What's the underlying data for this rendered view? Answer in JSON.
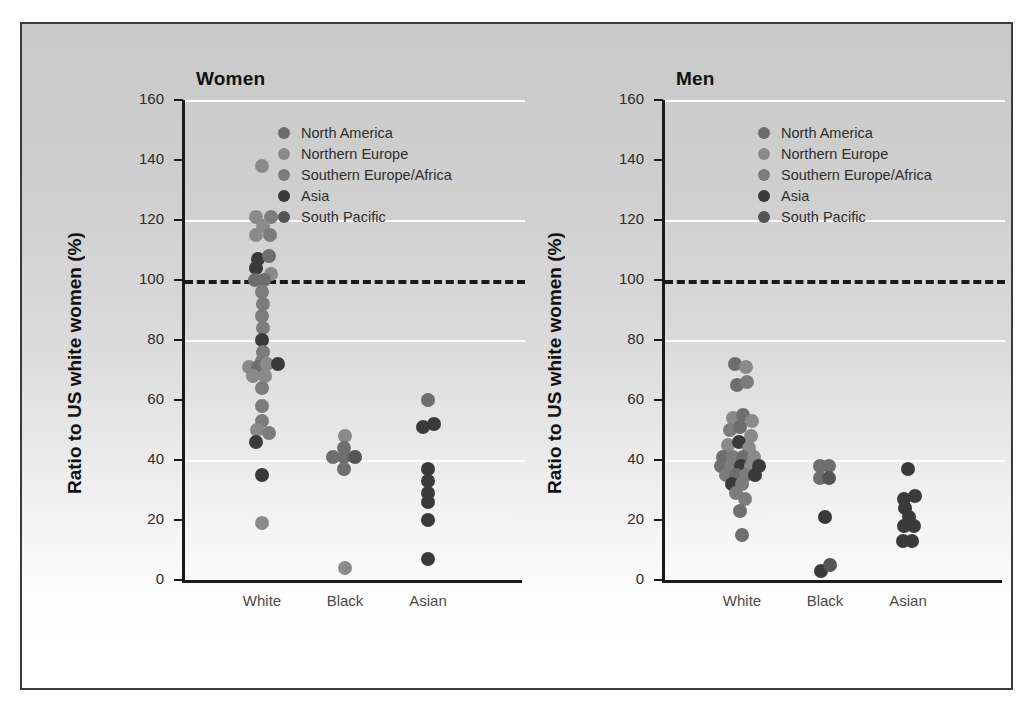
{
  "figure": {
    "background_top": "#c9c9c9",
    "background_bottom": "#ffffff",
    "border_color": "#3b3b3b"
  },
  "legend": {
    "entries": [
      {
        "label": "North America",
        "color": "#6e6e6e"
      },
      {
        "label": "Northern Europe",
        "color": "#8a8a8a"
      },
      {
        "label": "Southern Europe/Africa",
        "color": "#7c7c7c"
      },
      {
        "label": "Asia",
        "color": "#3a3a3a"
      },
      {
        "label": "South Pacific",
        "color": "#555555"
      }
    ]
  },
  "axis": {
    "ylabel": "Ratio to US  white women (%)",
    "yticks": [
      0,
      20,
      40,
      60,
      80,
      100,
      120,
      140,
      160
    ],
    "ylim": [
      0,
      160
    ],
    "gridlines": [
      40,
      80,
      120,
      160
    ],
    "reference_line": 100,
    "categories": [
      "White",
      "Black",
      "Asian"
    ]
  },
  "chart_data": {
    "type": "scatter",
    "xlabel": "",
    "ylabel": "Ratio to US  white women (%)",
    "ylim": [
      0,
      160
    ],
    "grid": true,
    "legend_position": "inside-top-right",
    "categories": [
      "White",
      "Black",
      "Asian"
    ],
    "reference_line": 100,
    "panels": [
      {
        "name": "Women",
        "points": [
          {
            "cat": "White",
            "x_off": 0,
            "y": 138,
            "region": "Northern Europe"
          },
          {
            "cat": "White",
            "x_off": -6,
            "y": 121,
            "region": "Northern Europe"
          },
          {
            "cat": "White",
            "x_off": 9,
            "y": 121,
            "region": "Southern Europe/Africa"
          },
          {
            "cat": "White",
            "x_off": 1,
            "y": 118,
            "region": "Northern Europe"
          },
          {
            "cat": "White",
            "x_off": -6,
            "y": 115,
            "region": "Northern Europe"
          },
          {
            "cat": "White",
            "x_off": 8,
            "y": 115,
            "region": "Southern Europe/Africa"
          },
          {
            "cat": "White",
            "x_off": -4,
            "y": 107,
            "region": "Asia"
          },
          {
            "cat": "White",
            "x_off": 7,
            "y": 108,
            "region": "North America"
          },
          {
            "cat": "White",
            "x_off": -6,
            "y": 104,
            "region": "Asia"
          },
          {
            "cat": "White",
            "x_off": 9,
            "y": 102,
            "region": "Northern Europe"
          },
          {
            "cat": "White",
            "x_off": -7,
            "y": 100,
            "region": "North America"
          },
          {
            "cat": "White",
            "x_off": 2,
            "y": 100,
            "region": "North America"
          },
          {
            "cat": "White",
            "x_off": 0,
            "y": 96,
            "region": "Southern Europe/Africa"
          },
          {
            "cat": "White",
            "x_off": 1,
            "y": 92,
            "region": "Southern Europe/Africa"
          },
          {
            "cat": "White",
            "x_off": 0,
            "y": 88,
            "region": "Southern Europe/Africa"
          },
          {
            "cat": "White",
            "x_off": 1,
            "y": 84,
            "region": "Southern Europe/Africa"
          },
          {
            "cat": "White",
            "x_off": 0,
            "y": 80,
            "region": "Asia"
          },
          {
            "cat": "White",
            "x_off": 1,
            "y": 76,
            "region": "Southern Europe/Africa"
          },
          {
            "cat": "White",
            "x_off": 0,
            "y": 73,
            "region": "Southern Europe/Africa"
          },
          {
            "cat": "White",
            "x_off": -13,
            "y": 71,
            "region": "Northern Europe"
          },
          {
            "cat": "White",
            "x_off": -4,
            "y": 71,
            "region": "North America"
          },
          {
            "cat": "White",
            "x_off": 5,
            "y": 72,
            "region": "Northern Europe"
          },
          {
            "cat": "White",
            "x_off": 16,
            "y": 72,
            "region": "Asia"
          },
          {
            "cat": "White",
            "x_off": -9,
            "y": 68,
            "region": "Northern Europe"
          },
          {
            "cat": "White",
            "x_off": 3,
            "y": 68,
            "region": "Northern Europe"
          },
          {
            "cat": "White",
            "x_off": 0,
            "y": 64,
            "region": "Southern Europe/Africa"
          },
          {
            "cat": "White",
            "x_off": 0,
            "y": 58,
            "region": "Southern Europe/Africa"
          },
          {
            "cat": "White",
            "x_off": 0,
            "y": 53,
            "region": "Southern Europe/Africa"
          },
          {
            "cat": "White",
            "x_off": -5,
            "y": 50,
            "region": "Northern Europe"
          },
          {
            "cat": "White",
            "x_off": 7,
            "y": 49,
            "region": "Southern Europe/Africa"
          },
          {
            "cat": "White",
            "x_off": -6,
            "y": 46,
            "region": "Asia"
          },
          {
            "cat": "White",
            "x_off": 0,
            "y": 35,
            "region": "Asia"
          },
          {
            "cat": "White",
            "x_off": 0,
            "y": 19,
            "region": "Northern Europe"
          },
          {
            "cat": "Black",
            "x_off": 0,
            "y": 48,
            "region": "Northern Europe"
          },
          {
            "cat": "Black",
            "x_off": -12,
            "y": 41,
            "region": "North America"
          },
          {
            "cat": "Black",
            "x_off": -1,
            "y": 41,
            "region": "North America"
          },
          {
            "cat": "Black",
            "x_off": 10,
            "y": 41,
            "region": "South Pacific"
          },
          {
            "cat": "Black",
            "x_off": -1,
            "y": 44,
            "region": "North America"
          },
          {
            "cat": "Black",
            "x_off": -1,
            "y": 37,
            "region": "North America"
          },
          {
            "cat": "Black",
            "x_off": 0,
            "y": 4,
            "region": "Northern Europe"
          },
          {
            "cat": "Asian",
            "x_off": 0,
            "y": 60,
            "region": "North America"
          },
          {
            "cat": "Asian",
            "x_off": -5,
            "y": 51,
            "region": "Asia"
          },
          {
            "cat": "Asian",
            "x_off": 6,
            "y": 52,
            "region": "Asia"
          },
          {
            "cat": "Asian",
            "x_off": 0,
            "y": 37,
            "region": "Asia"
          },
          {
            "cat": "Asian",
            "x_off": 0,
            "y": 33,
            "region": "Asia"
          },
          {
            "cat": "Asian",
            "x_off": 0,
            "y": 29,
            "region": "Asia"
          },
          {
            "cat": "Asian",
            "x_off": 0,
            "y": 26,
            "region": "Asia"
          },
          {
            "cat": "Asian",
            "x_off": 0,
            "y": 20,
            "region": "Asia"
          },
          {
            "cat": "Asian",
            "x_off": 0,
            "y": 7,
            "region": "Asia"
          }
        ]
      },
      {
        "name": "Men",
        "points": [
          {
            "cat": "White",
            "x_off": -7,
            "y": 72,
            "region": "North America"
          },
          {
            "cat": "White",
            "x_off": 4,
            "y": 71,
            "region": "Northern Europe"
          },
          {
            "cat": "White",
            "x_off": -5,
            "y": 65,
            "region": "North America"
          },
          {
            "cat": "White",
            "x_off": 5,
            "y": 66,
            "region": "Southern Europe/Africa"
          },
          {
            "cat": "White",
            "x_off": -9,
            "y": 54,
            "region": "Northern Europe"
          },
          {
            "cat": "White",
            "x_off": 1,
            "y": 55,
            "region": "North America"
          },
          {
            "cat": "White",
            "x_off": 10,
            "y": 53,
            "region": "Northern Europe"
          },
          {
            "cat": "White",
            "x_off": -12,
            "y": 50,
            "region": "Southern Europe/Africa"
          },
          {
            "cat": "White",
            "x_off": -2,
            "y": 51,
            "region": "North America"
          },
          {
            "cat": "White",
            "x_off": 9,
            "y": 48,
            "region": "Northern Europe"
          },
          {
            "cat": "White",
            "x_off": -14,
            "y": 45,
            "region": "Northern Europe"
          },
          {
            "cat": "White",
            "x_off": -3,
            "y": 46,
            "region": "Asia"
          },
          {
            "cat": "White",
            "x_off": 7,
            "y": 44,
            "region": "Northern Europe"
          },
          {
            "cat": "White",
            "x_off": -19,
            "y": 41,
            "region": "North America"
          },
          {
            "cat": "White",
            "x_off": -9,
            "y": 41,
            "region": "Southern Europe/Africa"
          },
          {
            "cat": "White",
            "x_off": 1,
            "y": 41,
            "region": "North America"
          },
          {
            "cat": "White",
            "x_off": 12,
            "y": 41,
            "region": "Northern Europe"
          },
          {
            "cat": "White",
            "x_off": -21,
            "y": 38,
            "region": "North America"
          },
          {
            "cat": "White",
            "x_off": -11,
            "y": 38,
            "region": "Southern Europe/Africa"
          },
          {
            "cat": "White",
            "x_off": -1,
            "y": 38,
            "region": "Asia"
          },
          {
            "cat": "White",
            "x_off": 9,
            "y": 38,
            "region": "Northern Europe"
          },
          {
            "cat": "White",
            "x_off": 17,
            "y": 38,
            "region": "Asia"
          },
          {
            "cat": "White",
            "x_off": -16,
            "y": 35,
            "region": "Southern Europe/Africa"
          },
          {
            "cat": "White",
            "x_off": -6,
            "y": 35,
            "region": "North America"
          },
          {
            "cat": "White",
            "x_off": 4,
            "y": 35,
            "region": "Southern Europe/Africa"
          },
          {
            "cat": "White",
            "x_off": 13,
            "y": 35,
            "region": "Asia"
          },
          {
            "cat": "White",
            "x_off": -10,
            "y": 32,
            "region": "Asia"
          },
          {
            "cat": "White",
            "x_off": 0,
            "y": 32,
            "region": "Southern Europe/Africa"
          },
          {
            "cat": "White",
            "x_off": -6,
            "y": 29,
            "region": "Southern Europe/Africa"
          },
          {
            "cat": "White",
            "x_off": 3,
            "y": 27,
            "region": "Southern Europe/Africa"
          },
          {
            "cat": "White",
            "x_off": -2,
            "y": 23,
            "region": "North America"
          },
          {
            "cat": "White",
            "x_off": 0,
            "y": 15,
            "region": "North America"
          },
          {
            "cat": "Black",
            "x_off": -5,
            "y": 38,
            "region": "North America"
          },
          {
            "cat": "Black",
            "x_off": 4,
            "y": 38,
            "region": "North America"
          },
          {
            "cat": "Black",
            "x_off": -5,
            "y": 34,
            "region": "North America"
          },
          {
            "cat": "Black",
            "x_off": 4,
            "y": 34,
            "region": "South Pacific"
          },
          {
            "cat": "Black",
            "x_off": 0,
            "y": 21,
            "region": "Asia"
          },
          {
            "cat": "Black",
            "x_off": -4,
            "y": 3,
            "region": "Asia"
          },
          {
            "cat": "Black",
            "x_off": 5,
            "y": 5,
            "region": "South Pacific"
          },
          {
            "cat": "Asian",
            "x_off": 0,
            "y": 37,
            "region": "Asia"
          },
          {
            "cat": "Asian",
            "x_off": -4,
            "y": 27,
            "region": "Asia"
          },
          {
            "cat": "Asian",
            "x_off": 7,
            "y": 28,
            "region": "Asia"
          },
          {
            "cat": "Asian",
            "x_off": -3,
            "y": 24,
            "region": "Asia"
          },
          {
            "cat": "Asian",
            "x_off": 1,
            "y": 21,
            "region": "Asia"
          },
          {
            "cat": "Asian",
            "x_off": -4,
            "y": 18,
            "region": "Asia"
          },
          {
            "cat": "Asian",
            "x_off": 6,
            "y": 18,
            "region": "Asia"
          },
          {
            "cat": "Asian",
            "x_off": -5,
            "y": 13,
            "region": "Asia"
          },
          {
            "cat": "Asian",
            "x_off": 4,
            "y": 13,
            "region": "Asia"
          }
        ]
      }
    ]
  },
  "panels": [
    {
      "title": "Women",
      "show_ylabel": true
    },
    {
      "title": "Men",
      "show_ylabel": true
    }
  ]
}
